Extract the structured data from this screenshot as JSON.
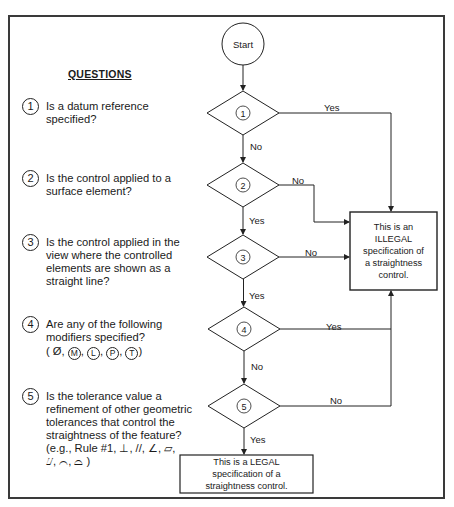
{
  "questions_heading": "QUESTIONS",
  "questions": [
    {
      "num": "1",
      "lines": [
        "Is a datum reference",
        "specified?"
      ]
    },
    {
      "num": "2",
      "lines": [
        "Is the control applied to a",
        "surface element?"
      ]
    },
    {
      "num": "3",
      "lines": [
        "Is the control applied in the",
        "view where the controlled",
        "elements are shown as a",
        "straight line?"
      ]
    },
    {
      "num": "4",
      "lines": [
        "Are any of the following",
        "modifiers specified?"
      ],
      "modifiers": [
        "Ø",
        "M",
        "L",
        "P",
        "T"
      ]
    },
    {
      "num": "5",
      "lines": [
        "Is the tolerance value a",
        "refinement of other geometric",
        "tolerances that control the",
        "straightness of the feature?",
        "(e.g., Rule #1,  ⊥,  //,  ∠,  ▱,",
        "⌰,  ⌒,  ⌓ )"
      ]
    }
  ],
  "flow": {
    "start": "Start",
    "decisions": [
      "1",
      "2",
      "3",
      "4",
      "5"
    ],
    "edges": {
      "d1_yes": "Yes",
      "d1_no": "No",
      "d2_no": "No",
      "d2_yes": "Yes",
      "d3_no": "No",
      "d3_yes": "Yes",
      "d4_yes": "Yes",
      "d4_no": "No",
      "d5_no": "No",
      "d5_yes": "Yes"
    },
    "illegal_box": [
      "This is an",
      "ILLEGAL",
      "specification of",
      "a straightness",
      "control."
    ],
    "legal_box": [
      "This is a LEGAL",
      "specification of a",
      "straightness control."
    ]
  }
}
